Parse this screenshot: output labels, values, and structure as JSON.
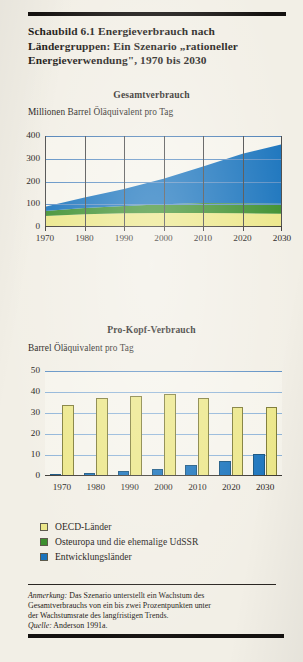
{
  "figure": {
    "title": "Schaubild 6.1   Energieverbrauch nach Ländergruppen: Ein Szenario „rationeller Energieverwendung\", 1970 bis 2030",
    "title_line1": "Schaubild 6.1   Energieverbrauch nach",
    "title_line2": "Ländergruppen: Ein Szenario „rationeller",
    "title_line3": "Energieverwendung\", 1970 bis 2030"
  },
  "legend": {
    "items": [
      {
        "label": "OECD-Länder",
        "color": "#ece789"
      },
      {
        "label": "Osteuropa und die ehemalige UdSSR",
        "color": "#3d8f2e"
      },
      {
        "label": "Entwicklungsländer",
        "color": "#1a74bd"
      }
    ]
  },
  "note": {
    "line1_label": "Anmerkung:",
    "line1": " Das Szenario unterstellt ein Wachstum des",
    "line2": "Gesamtverbrauchs von ein bis zwei Prozentpunkten unter",
    "line3": "der Wachstumsrate des langfristigen Trends.",
    "source_label": "Quelle:",
    "source": " Anderson 1991a."
  },
  "chart_data": [
    {
      "type": "area",
      "id": "gesamtverbrauch",
      "title": "Gesamtverbrauch",
      "ylabel": "Millionen Barrel Öläquivalent pro Tag",
      "xlabel": "",
      "stacked": true,
      "x": [
        1970,
        1980,
        1990,
        2000,
        2010,
        2020,
        2030
      ],
      "xticklabels": [
        "1970",
        "1980",
        "1990",
        "2000",
        "2010",
        "2020",
        "2030"
      ],
      "yticklabels": [
        "0",
        "100",
        "200",
        "300",
        "400"
      ],
      "yticks": [
        0,
        100,
        200,
        300,
        400
      ],
      "ylim": [
        0,
        400
      ],
      "grid": true,
      "legend_position": "below",
      "series": [
        {
          "name": "OECD-Länder",
          "color": "#ece789",
          "values": [
            48,
            56,
            60,
            62,
            62,
            60,
            58
          ]
        },
        {
          "name": "Osteuropa und die ehemalige UdSSR",
          "color": "#3d8f2e",
          "values": [
            22,
            28,
            32,
            38,
            44,
            44,
            44
          ]
        },
        {
          "name": "Entwicklungsländer",
          "color": "#1a74bd",
          "values": [
            19,
            46,
            75,
            112,
            160,
            218,
            262
          ]
        }
      ],
      "totals": [
        89,
        130,
        167,
        212,
        266,
        322,
        364
      ]
    },
    {
      "type": "bar",
      "id": "pro-kopf-verbrauch",
      "title": "Pro-Kopf-Verbrauch",
      "ylabel": "Barrel Öläquivalent pro Tag",
      "xlabel": "",
      "categories": [
        "1970",
        "1980",
        "1990",
        "2000",
        "2010",
        "2020",
        "2030"
      ],
      "yticklabels": [
        "0",
        "10",
        "20",
        "30",
        "40",
        "50"
      ],
      "yticks": [
        0,
        10,
        20,
        30,
        40,
        50
      ],
      "ylim": [
        0,
        50
      ],
      "grid": true,
      "legend_position": "below",
      "series": [
        {
          "name": "Entwicklungsländer",
          "color": "#1a74bd",
          "values": [
            0.8,
            1.5,
            2.2,
            3.2,
            5.2,
            7.2,
            10.5
          ]
        },
        {
          "name": "OECD-Länder",
          "color": "#ece789",
          "values": [
            34,
            37,
            38,
            39,
            37,
            33,
            33
          ]
        }
      ]
    }
  ]
}
